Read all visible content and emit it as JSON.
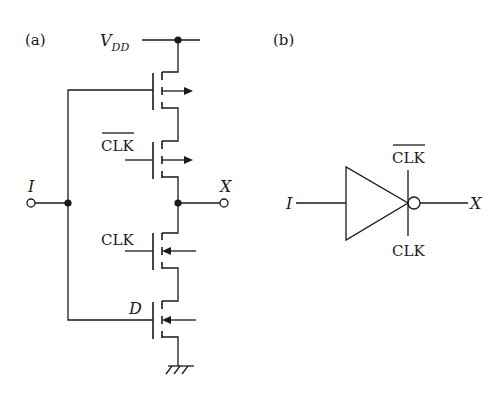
{
  "panels": [
    {
      "id": "a",
      "label": "(a)",
      "title": "Transistor-level clocked inverter",
      "supply_label_main": "V",
      "supply_label_sub": "DD",
      "input_label": "I",
      "output_label": "X",
      "transistors": [
        {
          "name": "T1",
          "type": "pmos",
          "gate_label": "",
          "gate_source": "I"
        },
        {
          "name": "T2",
          "type": "pmos",
          "gate_label": "CLK",
          "gate_overbar": true
        },
        {
          "name": "T3",
          "type": "nmos",
          "gate_label": "CLK",
          "gate_overbar": false
        },
        {
          "name": "T4",
          "type": "nmos",
          "gate_label": "D",
          "gate_italic": true
        }
      ],
      "ground_symbol": "ground-icon"
    },
    {
      "id": "b",
      "label": "(b)",
      "title": "Clocked inverter symbol",
      "input_label": "I",
      "output_label": "X",
      "top_control_label": "CLK",
      "top_control_overbar": true,
      "bottom_control_label": "CLK",
      "bottom_control_overbar": false
    }
  ],
  "colors": {
    "ink": "#1a1a1a",
    "background": "#ffffff"
  }
}
